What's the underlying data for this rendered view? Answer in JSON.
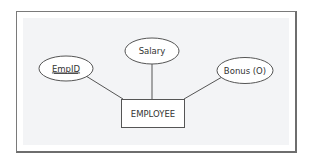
{
  "diagram": {
    "type": "er-diagram",
    "entity": {
      "label": "EMPLOYEE",
      "shape": "rectangle"
    },
    "attributes": [
      {
        "label": "EmpID",
        "shape": "ellipse",
        "key": true,
        "underlined": true
      },
      {
        "label": "Salary",
        "shape": "ellipse",
        "key": false,
        "underlined": false
      },
      {
        "label": "Bonus (O)",
        "shape": "ellipse",
        "key": false,
        "underlined": false
      }
    ],
    "relationships": [
      {
        "from": "EmpID",
        "to": "EMPLOYEE"
      },
      {
        "from": "Salary",
        "to": "EMPLOYEE"
      },
      {
        "from": "Bonus (O)",
        "to": "EMPLOYEE"
      }
    ],
    "colors": {
      "stroke": "#555555",
      "text": "#333333",
      "panel_bg": "#f3f4f6",
      "shape_fill": "#ffffff",
      "frame_border": "#7a7a7a"
    }
  }
}
